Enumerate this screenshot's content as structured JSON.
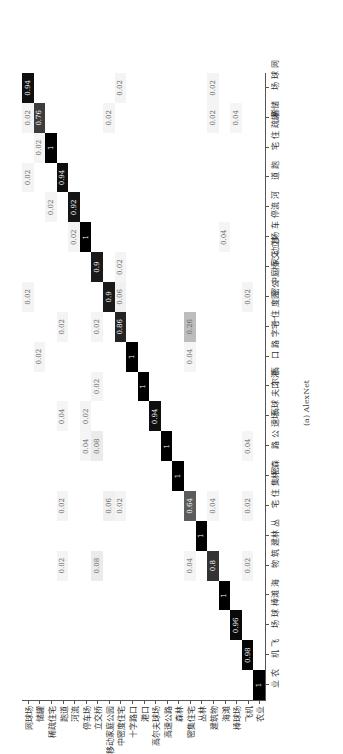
{
  "chart_data": {
    "type": "heatmap",
    "title": "",
    "caption": "(a) AlexNet",
    "xlabel": "",
    "ylabel": "",
    "orientation": "rotated 90deg counter-clockwise",
    "classes": [
      "农业",
      "飞机",
      "棒球场",
      "海滩",
      "建筑物",
      "丛林",
      "密集住宅",
      "森林",
      "高速公路",
      "高尔夫球场",
      "港口",
      "十字路口",
      "中密度住宅",
      "移动家庭公园",
      "立交桥",
      "停车场",
      "河流",
      "跑道",
      "稀疏住宅",
      "储罐",
      "网球场"
    ],
    "diagonal": [
      1,
      0.98,
      0.96,
      1,
      0.8,
      1,
      0.64,
      1,
      1,
      0.94,
      1,
      1,
      0.86,
      0.9,
      0.9,
      1,
      0.92,
      0.94,
      1,
      0.76,
      0.94
    ],
    "off_diagonal": [
      {
        "true": "飞机",
        "pred": "建筑物",
        "value": 0.02
      },
      {
        "true": "飞机",
        "pred": "密集住宅",
        "value": 0.02
      },
      {
        "true": "飞机",
        "pred": "高速公路",
        "value": 0.04
      },
      {
        "true": "飞机",
        "pred": "移动家庭公园",
        "value": 0.02
      },
      {
        "true": "棒球场",
        "pred": "储罐",
        "value": 0.04
      },
      {
        "true": "海滩",
        "pred": "停车场",
        "value": 0.04
      },
      {
        "true": "建筑物",
        "pred": "密集住宅",
        "value": 0.04
      },
      {
        "true": "建筑物",
        "pred": "网球场",
        "value": 0.02
      },
      {
        "true": "建筑物",
        "pred": "储罐",
        "value": 0.02
      },
      {
        "true": "密集住宅",
        "pred": "建筑物",
        "value": 0.04
      },
      {
        "true": "密集住宅",
        "pred": "中密度住宅",
        "value": 0.26
      },
      {
        "true": "密集住宅",
        "pred": "十字路口",
        "value": 0.04
      },
      {
        "true": "中密度住宅",
        "pred": "密集住宅",
        "value": 0.02
      },
      {
        "true": "中密度住宅",
        "pred": "移动家庭公园",
        "value": 0.06
      },
      {
        "true": "中密度住宅",
        "pred": "立交桥",
        "value": 0.02
      },
      {
        "true": "中密度住宅",
        "pred": "网球场",
        "value": 0.02
      },
      {
        "true": "移动家庭公园",
        "pred": "密集住宅",
        "value": 0.06
      },
      {
        "true": "移动家庭公园",
        "pred": "储罐",
        "value": 0.02
      },
      {
        "true": "立交桥",
        "pred": "高速公路",
        "value": 0.08
      },
      {
        "true": "立交桥",
        "pred": "建筑物",
        "value": 0.08
      },
      {
        "true": "立交桥",
        "pred": "港口",
        "value": 0.02
      },
      {
        "true": "立交桥",
        "pred": "中密度住宅",
        "value": 0.02
      },
      {
        "true": "停车场",
        "pred": "高速公路",
        "value": 0.04
      },
      {
        "true": "停车场",
        "pred": "高尔夫球场",
        "value": 0.02
      },
      {
        "true": "河流",
        "pred": "停车场",
        "value": 0.02
      },
      {
        "true": "跑道",
        "pred": "建筑物",
        "value": 0.02
      },
      {
        "true": "跑道",
        "pred": "密集住宅",
        "value": 0.02
      },
      {
        "true": "跑道",
        "pred": "高尔夫球场",
        "value": 0.04
      },
      {
        "true": "跑道",
        "pred": "中密度住宅",
        "value": 0.02
      },
      {
        "true": "稀疏住宅",
        "pred": "河流",
        "value": 0.02
      },
      {
        "true": "储罐",
        "pred": "稀疏住宅",
        "value": 0.02
      },
      {
        "true": "储罐",
        "pred": "十字路口",
        "value": 0.02
      },
      {
        "true": "网球场",
        "pred": "储罐",
        "value": 0.02
      },
      {
        "true": "网球场",
        "pred": "跑道",
        "value": 0.02
      },
      {
        "true": "网球场",
        "pred": "移动家庭公园",
        "value": 0.02
      }
    ],
    "colormap": "grayscale, darker = higher"
  }
}
